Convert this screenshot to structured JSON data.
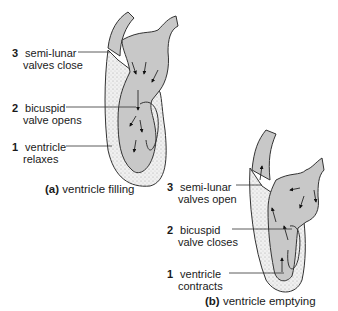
{
  "diagram_a": {
    "caption_letter": "(a)",
    "caption_text": "ventricle filling",
    "labels": [
      {
        "num": "3",
        "line1": "semi-lunar",
        "line2": "valves close"
      },
      {
        "num": "2",
        "line1": "bicuspid",
        "line2": "valve opens"
      },
      {
        "num": "1",
        "line1": "ventricle",
        "line2": "relaxes"
      }
    ]
  },
  "diagram_b": {
    "caption_letter": "(b)",
    "caption_text": "ventricle emptying",
    "labels": [
      {
        "num": "3",
        "line1": "semi-lunar",
        "line2": "valves open"
      },
      {
        "num": "2",
        "line1": "bicuspid",
        "line2": "valve closes"
      },
      {
        "num": "1",
        "line1": "ventricle",
        "line2": "contracts"
      }
    ]
  },
  "colors": {
    "blood": "#c8c8c8",
    "muscle": "#ebebeb",
    "outline": "#333333"
  }
}
